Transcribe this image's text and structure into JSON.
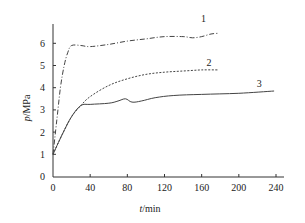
{
  "chart_data": {
    "type": "line",
    "title": "",
    "xlabel": "t/min",
    "ylabel": "p/MPa",
    "xlim": [
      0,
      240
    ],
    "ylim": [
      0,
      6.8
    ],
    "xticks": [
      0,
      40,
      80,
      120,
      160,
      200,
      240
    ],
    "yticks": [
      0,
      1,
      2,
      3,
      4,
      5,
      6
    ],
    "grid": false,
    "legend": "inline curve numbers",
    "series": [
      {
        "name": "1",
        "style": "dash-dot",
        "x": [
          0,
          4,
          8,
          12,
          16,
          20,
          30,
          40,
          60,
          80,
          100,
          120,
          140,
          150,
          160,
          170,
          178
        ],
        "y": [
          1.0,
          2.5,
          4.0,
          5.0,
          5.6,
          5.9,
          5.9,
          5.85,
          5.95,
          6.1,
          6.2,
          6.3,
          6.3,
          6.25,
          6.3,
          6.42,
          6.45
        ]
      },
      {
        "name": "2",
        "style": "dashed",
        "x": [
          0,
          10,
          20,
          30,
          40,
          60,
          80,
          100,
          120,
          140,
          160,
          178
        ],
        "y": [
          1.0,
          1.9,
          2.7,
          3.2,
          3.6,
          4.1,
          4.4,
          4.6,
          4.7,
          4.75,
          4.8,
          4.8
        ]
      },
      {
        "name": "3",
        "style": "solid",
        "x": [
          0,
          10,
          20,
          30,
          40,
          60,
          70,
          78,
          85,
          95,
          110,
          130,
          160,
          200,
          238
        ],
        "y": [
          1.0,
          1.9,
          2.7,
          3.2,
          3.25,
          3.3,
          3.4,
          3.5,
          3.35,
          3.4,
          3.55,
          3.65,
          3.7,
          3.75,
          3.85
        ]
      }
    ],
    "curve_labels": [
      {
        "text": "1",
        "x": 162,
        "y": 6.95
      },
      {
        "text": "2",
        "x": 168,
        "y": 5.0
      },
      {
        "text": "3",
        "x": 222,
        "y": 4.05
      }
    ]
  },
  "axes": {
    "x_title_italic": "t",
    "x_title_unit": "/min",
    "y_title_italic": "p",
    "y_title_unit": "/MPa"
  }
}
